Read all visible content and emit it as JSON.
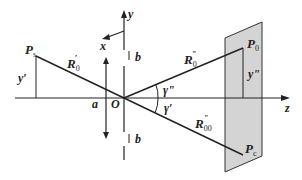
{
  "diagram": {
    "type": "geometry-projection",
    "colors": {
      "line": "#222222",
      "plane_fill": "#d4d4d4",
      "plane_stroke": "#333333",
      "background": "#ffffff"
    },
    "points": {
      "Ps": {
        "label": "P",
        "sub": "s"
      },
      "P0": {
        "label": "P",
        "sub": "0"
      },
      "Pc": {
        "label": "P",
        "sub": "c"
      },
      "O": {
        "label": "O"
      }
    },
    "axes": {
      "y": "y",
      "x": "x",
      "z": "z"
    },
    "segments": {
      "R0_prime": {
        "label": "R",
        "sub": "0",
        "sup": "′"
      },
      "R0_dblprime": {
        "label": "R",
        "sub": "0",
        "sup": "\""
      },
      "R00_dblprime": {
        "label": "R",
        "sub": "00",
        "sup": "\""
      }
    },
    "dimensions": {
      "y_prime": "y′",
      "y_dblprime": "y\"",
      "a": "a",
      "b_top": "b",
      "b_bottom": "b"
    },
    "angles": {
      "gamma_dblprime": "γ\"",
      "gamma_prime": "γ′"
    }
  }
}
